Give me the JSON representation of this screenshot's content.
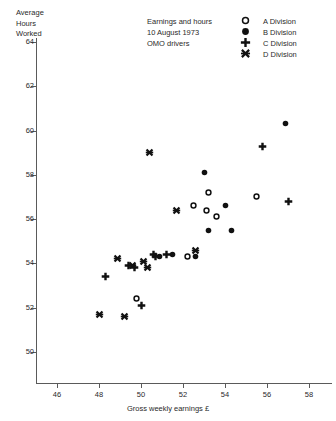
{
  "caption": {
    "line1": "Earnings and hours",
    "line2": "10 August 1973",
    "line3": "OMO drivers"
  },
  "axes": {
    "ytitle": "Average\nHours\nWorked",
    "xtitle": "Gross weekly earnings £"
  },
  "legend": {
    "items": [
      {
        "label": "A Division",
        "marker": "open-circle"
      },
      {
        "label": "B Division",
        "marker": "filled-circle"
      },
      {
        "label": "C Division",
        "marker": "plus"
      },
      {
        "label": "D Division",
        "marker": "cross-x"
      }
    ]
  },
  "chart_data": {
    "type": "scatter",
    "title": "Earnings and hours 10 August 1973 OMO drivers",
    "xlabel": "Gross weekly earnings £",
    "ylabel": "Average Hours Worked",
    "xlim": [
      45.0,
      58.9
    ],
    "ylim": [
      49.2,
      64.9
    ],
    "xticks": [
      46,
      48,
      50,
      52,
      54,
      56,
      58
    ],
    "yticks": [
      50,
      52,
      54,
      56,
      58,
      60,
      62,
      64
    ],
    "grid": false,
    "legend_position": "top-right",
    "series": [
      {
        "name": "A Division",
        "marker": "open-circle",
        "points": [
          {
            "x": 49.8,
            "y": 52.4
          },
          {
            "x": 52.5,
            "y": 56.6
          },
          {
            "x": 53.1,
            "y": 56.4
          },
          {
            "x": 53.6,
            "y": 56.1
          },
          {
            "x": 52.2,
            "y": 54.3
          },
          {
            "x": 53.2,
            "y": 57.2
          },
          {
            "x": 55.5,
            "y": 57.0
          }
        ]
      },
      {
        "name": "B Division",
        "marker": "filled-circle",
        "points": [
          {
            "x": 51.5,
            "y": 54.4
          },
          {
            "x": 52.6,
            "y": 54.3
          },
          {
            "x": 53.2,
            "y": 55.5
          },
          {
            "x": 53.0,
            "y": 58.1
          },
          {
            "x": 54.0,
            "y": 56.6
          },
          {
            "x": 54.3,
            "y": 55.5
          },
          {
            "x": 50.9,
            "y": 54.3
          },
          {
            "x": 56.9,
            "y": 60.3
          }
        ]
      },
      {
        "name": "C Division",
        "marker": "plus",
        "points": [
          {
            "x": 48.3,
            "y": 53.4
          },
          {
            "x": 49.4,
            "y": 53.9
          },
          {
            "x": 49.7,
            "y": 53.8
          },
          {
            "x": 50.0,
            "y": 52.1
          },
          {
            "x": 50.7,
            "y": 54.3
          },
          {
            "x": 51.2,
            "y": 54.4
          },
          {
            "x": 50.6,
            "y": 54.4
          },
          {
            "x": 57.0,
            "y": 56.8
          },
          {
            "x": 55.8,
            "y": 59.3
          }
        ]
      },
      {
        "name": "D Division",
        "marker": "cross-x",
        "points": [
          {
            "x": 48.0,
            "y": 51.7
          },
          {
            "x": 49.2,
            "y": 51.6
          },
          {
            "x": 48.9,
            "y": 54.2
          },
          {
            "x": 49.6,
            "y": 53.9
          },
          {
            "x": 50.1,
            "y": 54.1
          },
          {
            "x": 50.3,
            "y": 53.8
          },
          {
            "x": 50.4,
            "y": 59.0
          },
          {
            "x": 51.7,
            "y": 56.4
          },
          {
            "x": 52.6,
            "y": 54.6
          }
        ]
      }
    ]
  }
}
